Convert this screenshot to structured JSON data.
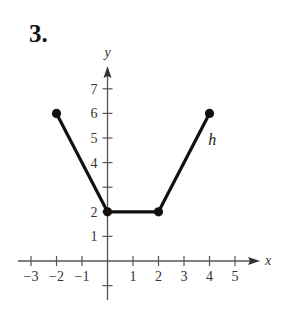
{
  "problem": {
    "number": "3."
  },
  "chart_data": {
    "type": "line",
    "title": "",
    "xlabel": "x",
    "ylabel": "y",
    "series": [
      {
        "name": "h",
        "x": [
          -2,
          0,
          2,
          4
        ],
        "y": [
          6,
          2,
          2,
          6
        ],
        "markers": "filled-circle-endpoints-and-vertices"
      }
    ],
    "x_ticks": [
      -3,
      -2,
      -1,
      1,
      2,
      3,
      4,
      5
    ],
    "y_ticks": [
      1,
      2,
      3,
      4,
      5,
      6,
      7
    ],
    "x_tick_labels": [
      "−3",
      "−2",
      "−1",
      "1",
      "2",
      "3",
      "4",
      "5"
    ],
    "y_tick_labels": [
      "1",
      "2",
      "4",
      "5",
      "6",
      "7"
    ],
    "xlim": [
      -3.5,
      6
    ],
    "ylim": [
      -1,
      8
    ],
    "grid": false,
    "legend": "none",
    "annotations": [
      {
        "text": "h",
        "x": 3.95,
        "y": 4.7
      }
    ]
  }
}
